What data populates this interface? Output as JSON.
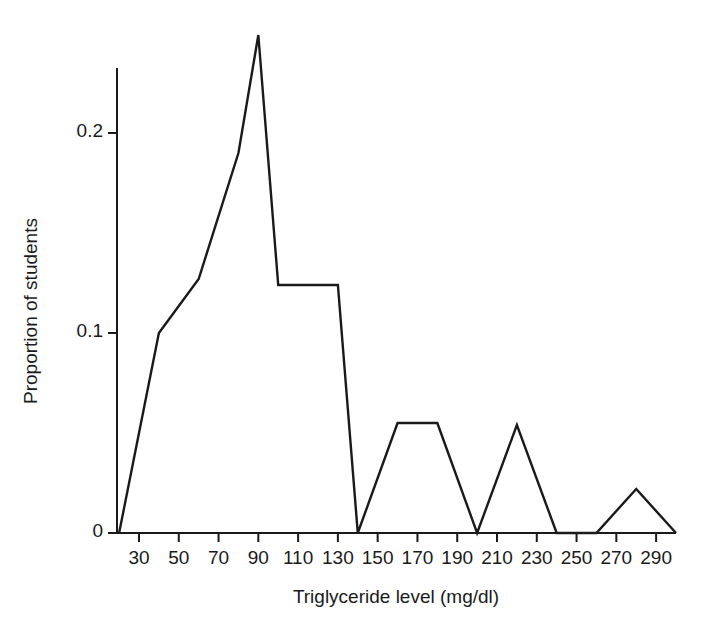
{
  "figure": {
    "clipped_header_text": "",
    "background_color": "#ffffff",
    "line_color": "#1a1a1a",
    "axis_color": "#1a1a1a"
  },
  "chart_data": {
    "type": "line",
    "subtype": "frequency-polygon",
    "title": "",
    "xlabel": "Triglyceride level (mg/dl)",
    "ylabel": "Proportion of students",
    "xlim": [
      20,
      300
    ],
    "ylim": [
      0,
      0.26
    ],
    "grid": false,
    "legend": null,
    "xticks": [
      30,
      50,
      70,
      90,
      110,
      130,
      150,
      170,
      190,
      210,
      230,
      250,
      270,
      290
    ],
    "xtick_labels": [
      "30",
      "50",
      "70",
      "90",
      "110",
      "130",
      "150",
      "170",
      "190",
      "210",
      "230",
      "250",
      "270",
      "290"
    ],
    "yticks": [
      0,
      0.1,
      0.2
    ],
    "ytick_labels": [
      "0",
      "0.1",
      "0.2"
    ],
    "x": [
      20,
      40,
      60,
      80,
      90,
      100,
      130,
      140,
      160,
      180,
      200,
      220,
      240,
      260,
      280,
      300
    ],
    "values": [
      0,
      0.1,
      0.127,
      0.19,
      0.249,
      0.124,
      0.124,
      0,
      0.055,
      0.055,
      0,
      0.054,
      0,
      0,
      0.022,
      0
    ],
    "points": [
      {
        "x": 20,
        "y": 0
      },
      {
        "x": 40,
        "y": 0.1
      },
      {
        "x": 60,
        "y": 0.127
      },
      {
        "x": 80,
        "y": 0.19
      },
      {
        "x": 90,
        "y": 0.249
      },
      {
        "x": 100,
        "y": 0.124
      },
      {
        "x": 130,
        "y": 0.124
      },
      {
        "x": 140,
        "y": 0
      },
      {
        "x": 160,
        "y": 0.055
      },
      {
        "x": 180,
        "y": 0.055
      },
      {
        "x": 200,
        "y": 0
      },
      {
        "x": 220,
        "y": 0.054
      },
      {
        "x": 240,
        "y": 0
      },
      {
        "x": 260,
        "y": 0
      },
      {
        "x": 280,
        "y": 0.022
      },
      {
        "x": 300,
        "y": 0
      }
    ]
  }
}
